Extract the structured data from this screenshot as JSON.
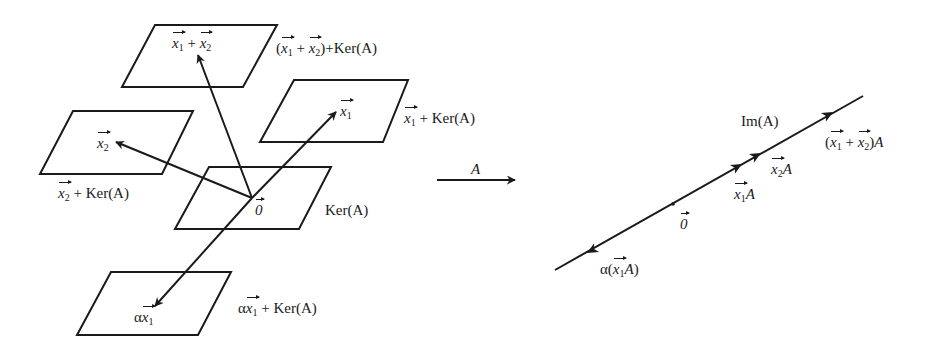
{
  "diagram": {
    "stroke_color": "#1a1a1a",
    "background": "#ffffff",
    "mapping_label": "A",
    "left_panel": {
      "origin": [
        252,
        198
      ],
      "planes": [
        {
          "id": "sum",
          "points": [
            [
              155,
              25
            ],
            [
              277,
              25
            ],
            [
              243,
              87
            ],
            [
              122,
              87
            ]
          ],
          "inner_label": "x1 + x2",
          "outer_label": "(x1 + x2) + Ker(A)"
        },
        {
          "id": "x1",
          "points": [
            [
              294,
              80
            ],
            [
              408,
              80
            ],
            [
              383,
              142
            ],
            [
              260,
              142
            ]
          ],
          "inner_label": "x1",
          "outer_label": "x1 + Ker(A)"
        },
        {
          "id": "x2",
          "points": [
            [
              73,
              111
            ],
            [
              193,
              111
            ],
            [
              162,
              174
            ],
            [
              40,
              174
            ]
          ],
          "inner_label": "x2",
          "outer_label": "x2 + Ker(A)"
        },
        {
          "id": "ker",
          "points": [
            [
              209,
              167
            ],
            [
              331,
              167
            ],
            [
              299,
              229
            ],
            [
              175,
              229
            ]
          ],
          "inner_label": "0",
          "outer_label": "Ker(A)"
        },
        {
          "id": "alpha",
          "points": [
            [
              111,
              272
            ],
            [
              231,
              272
            ],
            [
              198,
              335
            ],
            [
              77,
              335
            ]
          ],
          "inner_label": "αx1",
          "outer_label": "αx1 + Ker(A)"
        }
      ],
      "vectors": [
        {
          "id": "to-sum",
          "from": [
            252,
            198
          ],
          "to": [
            198,
            55
          ]
        },
        {
          "id": "to-x1",
          "from": [
            252,
            198
          ],
          "to": [
            336,
            112
          ]
        },
        {
          "id": "to-x2",
          "from": [
            252,
            198
          ],
          "to": [
            116,
            142
          ]
        },
        {
          "id": "to-alpha",
          "from": [
            252,
            198
          ],
          "to": [
            155,
            306
          ]
        }
      ]
    },
    "mapping_arrow": {
      "from": [
        437,
        180
      ],
      "to": [
        515,
        180
      ]
    },
    "right_panel": {
      "line": {
        "from": [
          555,
          270
        ],
        "to": [
          863,
          96
        ]
      },
      "origin_dot": [
        673,
        204
      ],
      "arrowheads": [
        {
          "id": "x1A",
          "at": [
            742,
            164
          ],
          "dir": "up"
        },
        {
          "id": "x2A",
          "at": [
            761,
            153
          ],
          "dir": "up"
        },
        {
          "id": "sumA",
          "at": [
            833,
            112
          ],
          "dir": "up"
        },
        {
          "id": "alphaA",
          "at": [
            587,
            253
          ],
          "dir": "down"
        }
      ],
      "labels": {
        "image": "Im(A)",
        "origin": "0",
        "x1A": "x1A",
        "x2A": "x2A",
        "sumA": "(x1 + x2)A",
        "alphaA": "α(x1A)"
      }
    }
  },
  "labels": {
    "ker": "Ker(A)",
    "A": "A",
    "Im": "Im(A)",
    "plus": "+",
    "alpha": "α",
    "zero": "0",
    "one": "1",
    "two": "2",
    "x": "x",
    "open": "(",
    "close": ")"
  }
}
